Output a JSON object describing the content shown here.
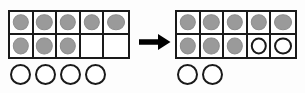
{
  "figure": {
    "background_color": "#fdfdfd",
    "filled_counter_color": "#9a9a9a",
    "open_counter_color": "#ffffff",
    "outline_color": "#1a1a1a"
  },
  "arrow": {
    "name": "right-arrow",
    "direction": "right",
    "color": "#000000"
  },
  "left_group": {
    "label": "before",
    "tenframe": {
      "rows": 2,
      "columns": 5,
      "cells": [
        "filled",
        "filled",
        "filled",
        "filled",
        "filled",
        "filled",
        "filled",
        "filled",
        "empty",
        "empty"
      ],
      "filled_count": 8,
      "open_count": 0,
      "empty_count": 2
    },
    "loose_counters": {
      "count": 4,
      "states": [
        "open",
        "open",
        "open",
        "open"
      ]
    },
    "total_counters": 12
  },
  "right_group": {
    "label": "after",
    "tenframe": {
      "rows": 2,
      "columns": 5,
      "cells": [
        "filled",
        "filled",
        "filled",
        "filled",
        "filled",
        "filled",
        "filled",
        "filled",
        "open",
        "open"
      ],
      "filled_count": 8,
      "open_count": 2,
      "empty_count": 0
    },
    "loose_counters": {
      "count": 2,
      "states": [
        "open",
        "open"
      ]
    },
    "total_counters": 12
  }
}
